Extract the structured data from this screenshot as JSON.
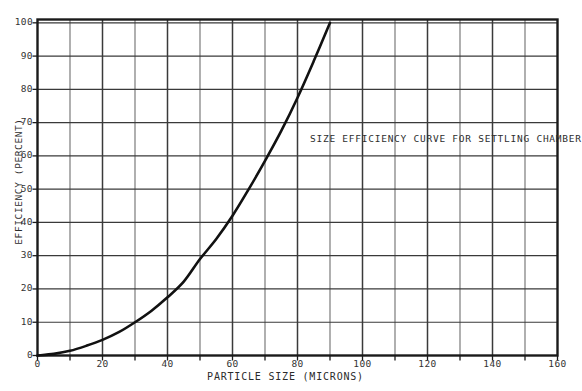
{
  "chart_data": {
    "type": "line",
    "title": "",
    "annotation": "SIZE EFFICIENCY CURVE FOR SETTLING CHAMBER",
    "xlabel": "PARTICLE SIZE (MICRONS)",
    "ylabel": "EFFICIENCY (PERCENT)",
    "xlim": [
      0,
      160
    ],
    "ylim": [
      0,
      101
    ],
    "xticks": [
      0,
      20,
      40,
      60,
      80,
      100,
      120,
      140,
      160
    ],
    "xtick_labels": [
      "0",
      "20",
      "40",
      "60",
      "80",
      "100",
      "120",
      "140",
      "160"
    ],
    "x_minor_step": 10,
    "yticks": [
      0,
      10,
      20,
      30,
      40,
      50,
      60,
      70,
      80,
      90,
      100
    ],
    "ytick_labels": [
      "0",
      "10",
      "20",
      "30",
      "40",
      "50",
      "60",
      "70",
      "80",
      "90",
      "100"
    ],
    "grid": true,
    "legend": null,
    "series": [
      {
        "name": "Size efficiency",
        "color": "#111111",
        "x": [
          0,
          5,
          10,
          15,
          20,
          25,
          30,
          35,
          40,
          45,
          50,
          55,
          60,
          65,
          70,
          75,
          80,
          85,
          90
        ],
        "y": [
          0,
          0.5,
          1.4,
          2.9,
          4.7,
          7.0,
          10.0,
          13.4,
          17.5,
          22.2,
          29.0,
          35.0,
          42.0,
          50.0,
          58.5,
          67.5,
          77.5,
          88.5,
          100
        ]
      }
    ]
  },
  "axis_colors": {
    "frame": "#1a1a1a",
    "major_grid": "#3a3a3a",
    "minor_grid": "#6e6e6e",
    "curve": "#111111",
    "background": "#ffffff"
  }
}
